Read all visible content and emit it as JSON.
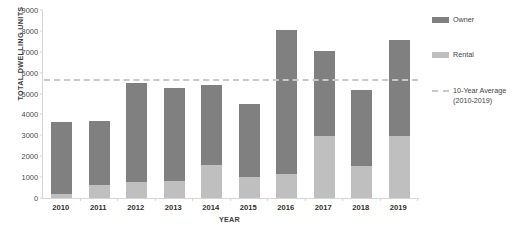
{
  "chart_data": {
    "type": "bar",
    "subtype": "stacked-vertical",
    "title": "",
    "xlabel": "YEAR",
    "ylabel": "TOTAL DWELLING UNITS",
    "categories": [
      "2010",
      "2011",
      "2012",
      "2013",
      "2014",
      "2015",
      "2016",
      "2017",
      "2018",
      "2019"
    ],
    "series": [
      {
        "name": "Rental",
        "color": "#bfbfbf",
        "values": [
          200,
          600,
          750,
          800,
          1600,
          1000,
          1150,
          2950,
          1550,
          2950
        ]
      },
      {
        "name": "Owner",
        "color": "#808080",
        "values": [
          3450,
          3100,
          4750,
          4450,
          3800,
          3500,
          6900,
          4100,
          3600,
          4600
        ]
      }
    ],
    "totals": [
      3650,
      3700,
      5500,
      5250,
      5400,
      4500,
      8050,
      7050,
      5150,
      7550
    ],
    "ylim": [
      0,
      9000
    ],
    "y_ticks": [
      "0",
      "1000",
      "2000",
      "3000",
      "4000",
      "5000",
      "6000",
      "7000",
      "8000",
      "9000"
    ],
    "y_tick_values": [
      0,
      1000,
      2000,
      3000,
      4000,
      5000,
      6000,
      7000,
      8000,
      9000
    ],
    "grid": false,
    "legend_position": "right",
    "reference_line": {
      "label": "10-Year Average\n(2010-2019)",
      "value": 5700,
      "style": "dashed",
      "color": "#c9c9c9"
    }
  },
  "legend": {
    "items": [
      {
        "label": "Owner",
        "swatch": "owner"
      },
      {
        "label": "Rental",
        "swatch": "rental"
      },
      {
        "label": "10-Year Average\n(2010-2019)",
        "swatch": "dash"
      }
    ]
  }
}
